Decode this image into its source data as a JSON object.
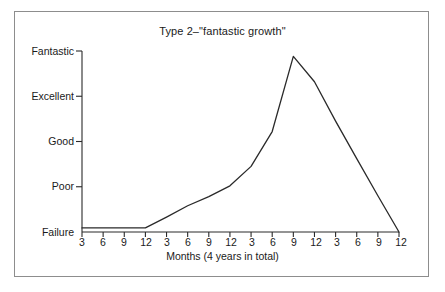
{
  "chart_data": {
    "type": "line",
    "title": "Type 2–\"fantastic growth\"",
    "xlabel": "Months (4 years in total)",
    "ylabel": "",
    "categories": [
      "3",
      "6",
      "9",
      "12",
      "3",
      "6",
      "9",
      "12",
      "3",
      "6",
      "9",
      "12",
      "3",
      "6",
      "9",
      "12"
    ],
    "ytick_labels": [
      "Failure",
      "Poor",
      "Good",
      "Excellent",
      "Fantastic"
    ],
    "ytick_values": [
      0,
      1,
      2,
      3,
      4
    ],
    "ylim": [
      0,
      4
    ],
    "grid": false,
    "legend": false,
    "series": [
      {
        "name": "growth",
        "values": [
          0.09,
          0.09,
          0.09,
          0.09,
          0.33,
          0.58,
          0.78,
          1.02,
          1.45,
          2.22,
          3.88,
          3.32,
          2.45,
          1.62,
          0.8,
          0.0
        ]
      }
    ],
    "annotations": []
  },
  "figure": {
    "frame_color": "#8d8d8d",
    "axis_color": "#2a2a2a",
    "line_color": "#2a2a2a",
    "background": "#ffffff"
  }
}
